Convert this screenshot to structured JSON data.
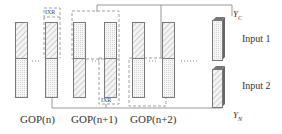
{
  "diagram": {
    "gop_labels": [
      "GOP(n)",
      "GOP(n+1)",
      "GOP(n+2)"
    ],
    "ixr_labels": [
      "IXR",
      "IXR"
    ],
    "inputs": [
      {
        "label": "Input 1",
        "var": "Y",
        "sub": "C"
      },
      {
        "label": "Input 2",
        "var": "Y",
        "sub": "N"
      }
    ],
    "ellipsis": "…",
    "colors": {
      "line": "#888888",
      "dash": "#999999",
      "bar_border": "#777777",
      "hatch": "#aaaaaa",
      "dots": "#cccccc",
      "text": "#333333"
    }
  }
}
